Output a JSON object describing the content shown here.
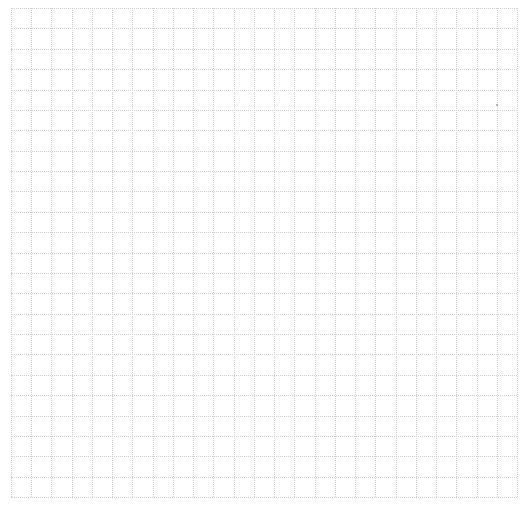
{
  "sheet": {
    "type": "graph-paper",
    "columns": 25,
    "rows": 24,
    "line_color": "#cfcfcf",
    "background_color": "#ffffff",
    "line_style": "dotted"
  }
}
